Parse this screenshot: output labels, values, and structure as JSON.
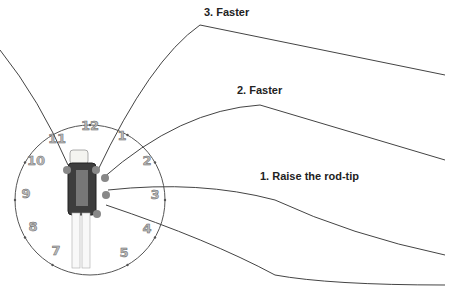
{
  "labels": {
    "step3": "3. Faster",
    "step2": "2. Faster",
    "step1": "1. Raise the rod-tip"
  },
  "clock": {
    "numbers": [
      "12",
      "1",
      "2",
      "3",
      "4",
      "5",
      "6",
      "7",
      "8",
      "9",
      "10",
      "11"
    ]
  }
}
